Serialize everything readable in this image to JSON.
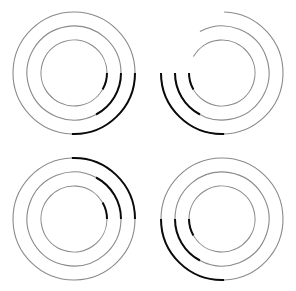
{
  "canvas": {
    "width": 295,
    "height": 291,
    "background": "#ffffff",
    "columns": 2,
    "rows": 2
  },
  "style": {
    "light_arc_color": "#8a8a8a",
    "dark_arc_color": "#0a0a0a",
    "light_arc_width": 1.1,
    "dark_arc_width": 2.0
  },
  "chart_data": {
    "type": "line",
    "title": "",
    "subtitle": "",
    "xlabel": "",
    "ylabel": "",
    "grid": false,
    "legend": null,
    "ring_radii": [
      33,
      47,
      61
    ],
    "figures": [
      {
        "name": "figure-top-left",
        "position": "top-left",
        "cx": 74,
        "cy": 73,
        "dark_quadrant": "lower-right",
        "rings": [
          {
            "radius": 33,
            "light_start": 30,
            "light_end": 360,
            "dark_start": 0,
            "dark_end": 30
          },
          {
            "radius": 47,
            "light_start": 62,
            "light_end": 360,
            "dark_start": 0,
            "dark_end": 62
          },
          {
            "radius": 61,
            "light_start": 92,
            "light_end": 360,
            "dark_start": 0,
            "dark_end": 92
          }
        ]
      },
      {
        "name": "figure-top-right",
        "position": "top-right",
        "cx": 74,
        "cy": 73,
        "dark_quadrant": "lower-left",
        "rings": [
          {
            "radius": 33,
            "light_start": 210,
            "light_end": 540,
            "dark_start": 150,
            "dark_end": 180
          },
          {
            "radius": 47,
            "light_start": 242,
            "light_end": 540,
            "dark_start": 118,
            "dark_end": 180
          },
          {
            "radius": 61,
            "light_start": 272,
            "light_end": 540,
            "dark_start": 88,
            "dark_end": 180
          }
        ]
      },
      {
        "name": "figure-bottom-left",
        "position": "bottom-left",
        "cx": 74,
        "cy": 73,
        "dark_quadrant": "upper-right",
        "rings": [
          {
            "radius": 33,
            "light_start": 0,
            "light_end": 330,
            "dark_start": 330,
            "dark_end": 360
          },
          {
            "radius": 47,
            "light_start": 0,
            "light_end": 298,
            "dark_start": 298,
            "dark_end": 360
          },
          {
            "radius": 61,
            "light_start": 0,
            "light_end": 268,
            "dark_start": 268,
            "dark_end": 360
          }
        ]
      },
      {
        "name": "figure-bottom-right",
        "position": "bottom-right",
        "cx": 74,
        "cy": 73,
        "dark_quadrant": "upper-left",
        "rings": [
          {
            "radius": 33,
            "light_start": 180,
            "light_end": 510,
            "dark_start": 150,
            "dark_end": 180
          },
          {
            "radius": 47,
            "light_start": 180,
            "light_end": 478,
            "dark_start": 118,
            "dark_end": 180
          },
          {
            "radius": 61,
            "light_start": 180,
            "light_end": 448,
            "dark_start": 88,
            "dark_end": 180
          }
        ]
      }
    ]
  }
}
